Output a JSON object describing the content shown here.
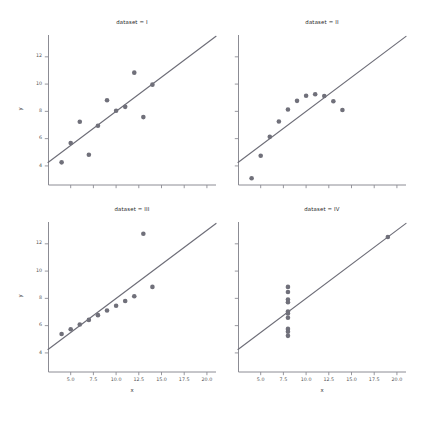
{
  "figure": {
    "kind": "anscombe-quartet-lmplot",
    "background_color": "#ffffff",
    "width": 425,
    "height": 424,
    "point_color": "#4c72b0",
    "point_render_color": "#70707a",
    "line_color": "#6e6e78",
    "axis_color": "#8c8c94",
    "text_color": "#5a5a5a"
  },
  "axis_labels": {
    "x": "x",
    "y": "y"
  },
  "ticks": {
    "x": [
      "5.0",
      "7.5",
      "10.0",
      "12.5",
      "15.0",
      "17.5",
      "20.0"
    ],
    "x_values": [
      5.0,
      7.5,
      10.0,
      12.5,
      15.0,
      17.5,
      20.0
    ],
    "y": [
      "4",
      "6",
      "8",
      "10",
      "12"
    ],
    "y_values": [
      4,
      6,
      8,
      10,
      12
    ]
  },
  "chart_data": {
    "type": "scatter",
    "title": "",
    "xlabel": "x",
    "ylabel": "y",
    "xlim": [
      2.5,
      21.0
    ],
    "ylim": [
      2.6,
      13.6
    ],
    "grid": false,
    "legend": "none",
    "facet_layout": {
      "rows": 2,
      "cols": 2
    },
    "panels": [
      {
        "title": "dataset = I",
        "dataset": "I",
        "row": 0,
        "col": 0,
        "x": [
          10.0,
          8.0,
          13.0,
          9.0,
          11.0,
          14.0,
          6.0,
          4.0,
          12.0,
          7.0,
          5.0
        ],
        "y": [
          8.04,
          6.95,
          7.58,
          8.81,
          8.33,
          9.96,
          7.24,
          4.26,
          10.84,
          4.82,
          5.68
        ],
        "fit_line": {
          "slope": 0.5001,
          "intercept": 3.0001
        }
      },
      {
        "title": "dataset = II",
        "dataset": "II",
        "row": 0,
        "col": 1,
        "x": [
          10.0,
          8.0,
          13.0,
          9.0,
          11.0,
          14.0,
          6.0,
          4.0,
          12.0,
          7.0,
          5.0
        ],
        "y": [
          9.14,
          8.14,
          8.74,
          8.77,
          9.26,
          8.1,
          6.13,
          3.1,
          9.13,
          7.26,
          4.74
        ],
        "fit_line": {
          "slope": 0.5,
          "intercept": 3.001
        }
      },
      {
        "title": "dataset = III",
        "dataset": "III",
        "row": 1,
        "col": 0,
        "x": [
          10.0,
          8.0,
          13.0,
          9.0,
          11.0,
          14.0,
          6.0,
          4.0,
          12.0,
          7.0,
          5.0
        ],
        "y": [
          7.46,
          6.77,
          12.74,
          7.11,
          7.81,
          8.84,
          6.08,
          5.39,
          8.15,
          6.42,
          5.73
        ],
        "fit_line": {
          "slope": 0.4997,
          "intercept": 3.0025
        }
      },
      {
        "title": "dataset = IV",
        "dataset": "IV",
        "row": 1,
        "col": 1,
        "x": [
          8.0,
          8.0,
          8.0,
          8.0,
          8.0,
          8.0,
          8.0,
          19.0,
          8.0,
          8.0,
          8.0
        ],
        "y": [
          6.58,
          5.76,
          7.71,
          8.84,
          8.47,
          7.04,
          5.25,
          12.5,
          5.56,
          7.91,
          6.89
        ],
        "fit_line": {
          "slope": 0.4999,
          "intercept": 3.0017
        }
      }
    ]
  }
}
